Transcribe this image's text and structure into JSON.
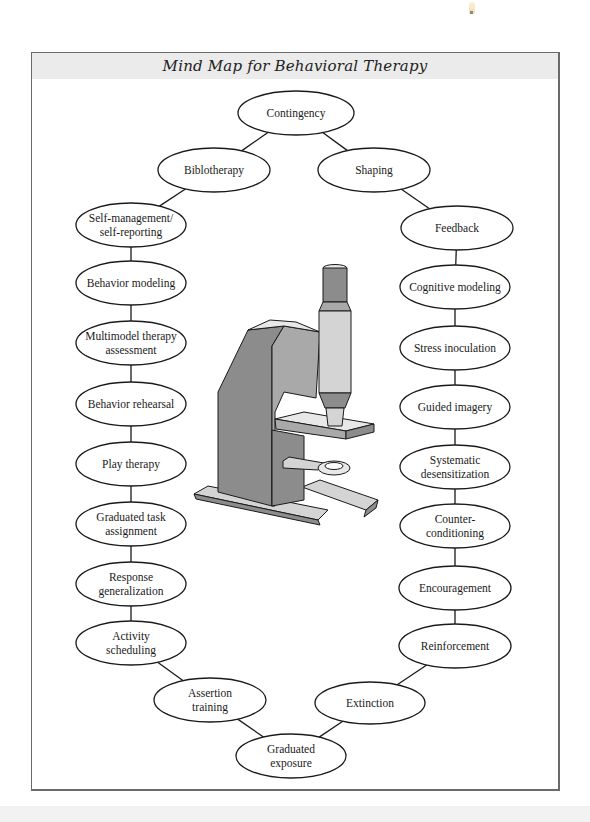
{
  "title": "Mind Map for Behavioral Therapy",
  "center_image": "microscope-illustration",
  "nodes": [
    {
      "id": "contingency",
      "lines": [
        "Contingency"
      ],
      "cx": 296,
      "cy": 113,
      "rx": 58,
      "ry": 22
    },
    {
      "id": "biblotherapy",
      "lines": [
        "Biblotherapy"
      ],
      "cx": 214,
      "cy": 170,
      "rx": 56,
      "ry": 22
    },
    {
      "id": "shaping",
      "lines": [
        "Shaping"
      ],
      "cx": 374,
      "cy": 170,
      "rx": 56,
      "ry": 22
    },
    {
      "id": "self-management",
      "lines": [
        "Self-management/",
        "self-reporting"
      ],
      "cx": 131,
      "cy": 225,
      "rx": 55,
      "ry": 22
    },
    {
      "id": "behavior-modeling",
      "lines": [
        "Behavior modeling"
      ],
      "cx": 131,
      "cy": 283,
      "rx": 55,
      "ry": 22
    },
    {
      "id": "multimodel",
      "lines": [
        "Multimodel therapy",
        "assessment"
      ],
      "cx": 131,
      "cy": 343,
      "rx": 55,
      "ry": 22
    },
    {
      "id": "behavior-rehearsal",
      "lines": [
        "Behavior rehearsal"
      ],
      "cx": 131,
      "cy": 404,
      "rx": 55,
      "ry": 22
    },
    {
      "id": "play-therapy",
      "lines": [
        "Play therapy"
      ],
      "cx": 131,
      "cy": 464,
      "rx": 55,
      "ry": 22
    },
    {
      "id": "graduated-task",
      "lines": [
        "Graduated task",
        "assignment"
      ],
      "cx": 131,
      "cy": 524,
      "rx": 55,
      "ry": 22
    },
    {
      "id": "response-generalization",
      "lines": [
        "Response",
        "generalization"
      ],
      "cx": 131,
      "cy": 584,
      "rx": 55,
      "ry": 22
    },
    {
      "id": "activity-scheduling",
      "lines": [
        "Activity",
        "scheduling"
      ],
      "cx": 131,
      "cy": 643,
      "rx": 55,
      "ry": 22
    },
    {
      "id": "assertion-training",
      "lines": [
        "Assertion",
        "training"
      ],
      "cx": 210,
      "cy": 700,
      "rx": 56,
      "ry": 22
    },
    {
      "id": "graduated-exposure",
      "lines": [
        "Graduated",
        "exposure"
      ],
      "cx": 291,
      "cy": 756,
      "rx": 55,
      "ry": 22
    },
    {
      "id": "extinction",
      "lines": [
        "Extinction"
      ],
      "cx": 370,
      "cy": 703,
      "rx": 55,
      "ry": 21
    },
    {
      "id": "reinforcement",
      "lines": [
        "Reinforcement"
      ],
      "cx": 455,
      "cy": 646,
      "rx": 56,
      "ry": 22
    },
    {
      "id": "encouragement",
      "lines": [
        "Encouragement"
      ],
      "cx": 455,
      "cy": 588,
      "rx": 56,
      "ry": 22
    },
    {
      "id": "counter-conditioning",
      "lines": [
        "Counter-",
        "conditioning"
      ],
      "cx": 455,
      "cy": 526,
      "rx": 55,
      "ry": 22
    },
    {
      "id": "systematic-desensitization",
      "lines": [
        "Systematic",
        "desensitization"
      ],
      "cx": 455,
      "cy": 467,
      "rx": 55,
      "ry": 22
    },
    {
      "id": "guided-imagery",
      "lines": [
        "Guided imagery"
      ],
      "cx": 455,
      "cy": 407,
      "rx": 55,
      "ry": 22
    },
    {
      "id": "stress-inoculation",
      "lines": [
        "Stress inoculation"
      ],
      "cx": 455,
      "cy": 348,
      "rx": 55,
      "ry": 22
    },
    {
      "id": "cognitive-modeling",
      "lines": [
        "Cognitive modeling"
      ],
      "cx": 455,
      "cy": 287,
      "rx": 55,
      "ry": 22
    },
    {
      "id": "feedback",
      "lines": [
        "Feedback"
      ],
      "cx": 457,
      "cy": 228,
      "rx": 56,
      "ry": 22
    }
  ],
  "edges": [
    [
      "contingency",
      "biblotherapy"
    ],
    [
      "contingency",
      "shaping"
    ],
    [
      "biblotherapy",
      "self-management"
    ],
    [
      "self-management",
      "behavior-modeling"
    ],
    [
      "behavior-modeling",
      "multimodel"
    ],
    [
      "multimodel",
      "behavior-rehearsal"
    ],
    [
      "behavior-rehearsal",
      "play-therapy"
    ],
    [
      "play-therapy",
      "graduated-task"
    ],
    [
      "graduated-task",
      "response-generalization"
    ],
    [
      "response-generalization",
      "activity-scheduling"
    ],
    [
      "activity-scheduling",
      "assertion-training"
    ],
    [
      "assertion-training",
      "graduated-exposure"
    ],
    [
      "graduated-exposure",
      "extinction"
    ],
    [
      "extinction",
      "reinforcement"
    ],
    [
      "reinforcement",
      "encouragement"
    ],
    [
      "encouragement",
      "counter-conditioning"
    ],
    [
      "counter-conditioning",
      "systematic-desensitization"
    ],
    [
      "systematic-desensitization",
      "guided-imagery"
    ],
    [
      "guided-imagery",
      "stress-inoculation"
    ],
    [
      "stress-inoculation",
      "cognitive-modeling"
    ],
    [
      "cognitive-modeling",
      "feedback"
    ],
    [
      "feedback",
      "shaping"
    ]
  ],
  "colors": {
    "stroke": "#1a1a1a",
    "title_band": "#ebebeb",
    "scope_dark": "#8c8c8c",
    "scope_mid": "#a9a9a9",
    "scope_light": "#d4d4d4",
    "scope_lighter": "#e8e8e8"
  }
}
